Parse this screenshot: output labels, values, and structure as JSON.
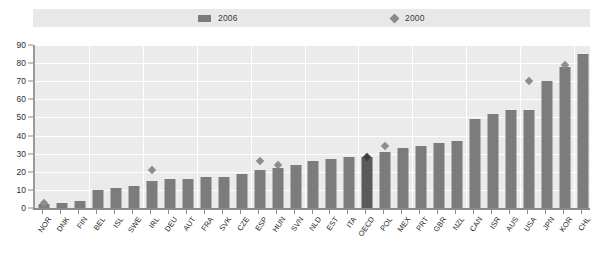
{
  "legend": {
    "entries": [
      {
        "label": "2006",
        "icon": "bar-swatch",
        "color": "#7b7b7b"
      },
      {
        "label": "2000",
        "icon": "diamond-marker",
        "color": "#8a8a8a"
      }
    ]
  },
  "colors": {
    "bar_2006": "#7c7c7c",
    "bar_highlight": "#5a5a5a",
    "marker_2000": "#8d8d8d",
    "marker_highlight": "#3f3f3f",
    "plot_background": "#ebebeb",
    "gridline": "#ffffff",
    "axis": "#8a8a8a",
    "legend_background": "#e8e8e8"
  },
  "chart_data": {
    "type": "bar",
    "title": "",
    "subtitle": "",
    "xlabel": "",
    "ylabel": "",
    "ylim": [
      0,
      90
    ],
    "yticks": [
      0,
      10,
      20,
      30,
      40,
      50,
      60,
      70,
      80,
      90
    ],
    "grid": true,
    "legend_position": "top",
    "categories": [
      "NOR",
      "DNK",
      "FIN",
      "BEL",
      "ISL",
      "SWE",
      "IRL",
      "DEU",
      "AUT",
      "FRA",
      "SVK",
      "CZE",
      "ESP",
      "HUN",
      "SVN",
      "NLD",
      "EST",
      "ITA",
      "OECD",
      "POL",
      "MEX",
      "PRT",
      "GBR",
      "NZL",
      "CAN",
      "ISR",
      "AUS",
      "USA",
      "JPN",
      "KOR",
      "CHL"
    ],
    "highlight_category": "OECD",
    "series": [
      {
        "name": "2006",
        "type": "bar",
        "values": [
          2,
          3,
          4,
          10,
          11,
          12,
          15,
          16,
          16,
          17,
          17,
          19,
          21,
          22,
          24,
          26,
          27,
          28,
          28,
          31,
          33,
          34,
          36,
          37,
          49,
          52,
          54,
          54,
          70,
          78,
          85
        ]
      },
      {
        "name": "2000",
        "type": "scatter",
        "marker": "diamond",
        "values": [
          3,
          null,
          null,
          null,
          null,
          null,
          21,
          null,
          null,
          null,
          null,
          null,
          26,
          24,
          null,
          null,
          null,
          null,
          28,
          34,
          null,
          null,
          null,
          null,
          null,
          null,
          null,
          70,
          null,
          79,
          null
        ]
      }
    ]
  }
}
